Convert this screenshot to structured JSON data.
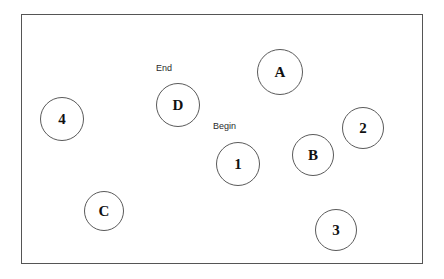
{
  "diagram": {
    "title": "",
    "frame": {
      "x": 21,
      "y": 14,
      "width": 402,
      "height": 250,
      "border_color": "#555555",
      "background": "#ffffff"
    },
    "node_stroke_color": "#5a5a5a",
    "node_text_color": "#111111",
    "annotation_color": "#2b2b2b",
    "nodes": [
      {
        "label": "A",
        "cx": 280,
        "cy": 72,
        "r": 23
      },
      {
        "label": "D",
        "cx": 178,
        "cy": 105,
        "r": 22
      },
      {
        "label": "4",
        "cx": 62,
        "cy": 119,
        "r": 22
      },
      {
        "label": "2",
        "cx": 363,
        "cy": 128,
        "r": 21
      },
      {
        "label": "B",
        "cx": 313,
        "cy": 155,
        "r": 21
      },
      {
        "label": "1",
        "cx": 238,
        "cy": 164,
        "r": 22
      },
      {
        "label": "C",
        "cx": 104,
        "cy": 211,
        "r": 20
      },
      {
        "label": "3",
        "cx": 336,
        "cy": 230,
        "r": 21
      }
    ],
    "annotations": [
      {
        "text": "End",
        "x": 156,
        "y": 64,
        "target": "D"
      },
      {
        "text": "Begin",
        "x": 213,
        "y": 122,
        "target": "1"
      }
    ]
  }
}
